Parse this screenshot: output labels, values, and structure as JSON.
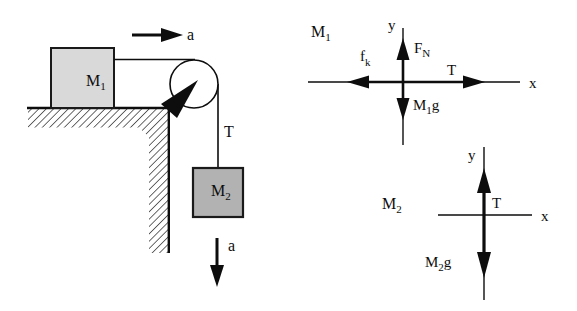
{
  "figure": {
    "left_diagram": {
      "accel_top_label": "a",
      "accel_bottom_label": "a",
      "block1_label": {
        "main": "M",
        "sub": "1"
      },
      "block2_label": {
        "main": "M",
        "sub": "2"
      },
      "rope_tension_label": "T",
      "colors": {
        "block1_fill": "#d9d9d9",
        "block2_fill": "#b2b2b2",
        "line": "#0d0d0d",
        "hatch": "#3a3a3a"
      }
    },
    "fbd1": {
      "title": {
        "main": "M",
        "sub": "1"
      },
      "axis_y_label": "y",
      "axis_x_label": "x",
      "forces": {
        "normal": {
          "main": "F",
          "sub": "N"
        },
        "friction": {
          "main": "f",
          "sub": "k"
        },
        "tension": "T",
        "weight": {
          "main": "M",
          "sub": "1",
          "suffix": "g"
        }
      }
    },
    "fbd2": {
      "title": {
        "main": "M",
        "sub": "2"
      },
      "axis_y_label": "y",
      "axis_x_label": "x",
      "forces": {
        "tension": "T",
        "weight": {
          "main": "M",
          "sub": "2",
          "suffix": "g"
        }
      }
    }
  }
}
